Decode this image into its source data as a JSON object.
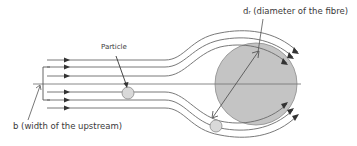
{
  "diagram": {
    "labels": {
      "particle": "Particle",
      "fibre_diameter": "dᵣ (diameter of the fibre)",
      "upstream_width": "b (width of the upstream)"
    },
    "colors": {
      "background": "#ffffff",
      "fibre_fill": "#c4c4c4",
      "fibre_stroke": "#8a8a8a",
      "particle_fill": "#d9d9d9",
      "streamline": "#6a6a6a",
      "arrow": "#333333",
      "text": "#3a3a3a"
    },
    "elements": {
      "fibre": "circle",
      "particles": 2,
      "streamlines_upper": 3,
      "streamlines_lower": 3,
      "centerline": 1
    }
  }
}
